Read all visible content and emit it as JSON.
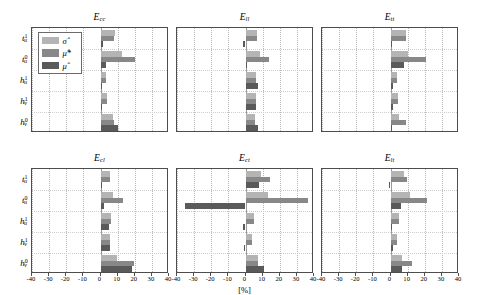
{
  "figure": {
    "xlabel": "[%]",
    "legend": [
      {
        "key": "sigma",
        "label_html": "σ̂",
        "color": "#b4b4b4"
      },
      {
        "key": "mustar",
        "label_html": "μ̂*",
        "color": "#888888"
      },
      {
        "key": "mu",
        "label_html": "μ̂",
        "color": "#5a5a5a"
      }
    ],
    "y_categories": [
      "t¹ᵤ",
      "t⁰ᵤ",
      "h¹ᵤ",
      "h¹ᵥ",
      "h⁰ᵥ"
    ],
    "y_categories_parts": [
      {
        "base": "t",
        "sup": "1",
        "sub": "u"
      },
      {
        "base": "t",
        "sup": "0",
        "sub": "u"
      },
      {
        "base": "h",
        "sup": "1",
        "sub": "u"
      },
      {
        "base": "h",
        "sup": "1",
        "sub": "v"
      },
      {
        "base": "h",
        "sup": "0",
        "sub": "v"
      }
    ],
    "x_ticks": [
      -40,
      -30,
      -20,
      -10,
      0,
      10,
      20,
      30,
      40
    ],
    "x_tick_labels": [
      "-40",
      "-30",
      "-20",
      "-10",
      "0",
      "10",
      "20",
      "30",
      "40"
    ],
    "xlim": [
      -40,
      40
    ]
  },
  "chart_data": {
    "type": "bar",
    "orientation": "horizontal",
    "title": "",
    "xlabel": "[%]",
    "ylabel": "",
    "xlim": [
      -40,
      40
    ],
    "grid": true,
    "legend_position": "upper-left-first-panel",
    "categories": [
      "t1_u",
      "t0_u",
      "h1_u",
      "h1_v",
      "h0_v"
    ],
    "series_names": [
      "sigma_hat",
      "mu_hat_star",
      "mu_hat"
    ],
    "panels": [
      {
        "id": "Ecc",
        "title_base": "E",
        "title_sub": "cc",
        "row": 0,
        "col": 0,
        "series": [
          {
            "name": "sigma_hat",
            "values": [
              8.5,
              12.5,
              3.5,
              4.0,
              7.5
            ]
          },
          {
            "name": "mu_hat_star",
            "values": [
              8.0,
              20.0,
              3.5,
              4.0,
              8.0
            ]
          },
          {
            "name": "mu_hat",
            "values": [
              1.5,
              3.0,
              0.7,
              0.0,
              10.0
            ]
          }
        ]
      },
      {
        "id": "Ell",
        "title_base": "E",
        "title_sub": "ll",
        "row": 0,
        "col": 1,
        "series": [
          {
            "name": "sigma_hat",
            "values": [
              7.0,
              8.5,
              6.0,
              6.0,
              5.5
            ]
          },
          {
            "name": "mu_hat_star",
            "values": [
              7.0,
              13.5,
              6.0,
              6.0,
              5.5
            ]
          },
          {
            "name": "mu_hat",
            "values": [
              -1.5,
              0.5,
              7.5,
              6.0,
              7.5
            ]
          }
        ]
      },
      {
        "id": "Ett",
        "title_base": "E",
        "title_sub": "tt",
        "row": 0,
        "col": 2,
        "series": [
          {
            "name": "sigma_hat",
            "values": [
              9.0,
              10.5,
              4.0,
              4.5,
              5.0
            ]
          },
          {
            "name": "mu_hat_star",
            "values": [
              9.0,
              21.0,
              4.0,
              4.5,
              9.0
            ]
          },
          {
            "name": "mu_hat",
            "values": [
              0.5,
              8.0,
              1.5,
              1.5,
              1.0
            ]
          }
        ]
      },
      {
        "id": "Ecl",
        "title_base": "E",
        "title_sub": "cl",
        "row": 1,
        "col": 0,
        "series": [
          {
            "name": "sigma_hat",
            "values": [
              5.5,
              7.5,
              6.0,
              5.5,
              9.5
            ]
          },
          {
            "name": "mu_hat_star",
            "values": [
              5.5,
              13.0,
              6.0,
              5.5,
              19.5
            ]
          },
          {
            "name": "mu_hat",
            "values": [
              0.5,
              2.0,
              5.0,
              5.5,
              18.5
            ]
          }
        ]
      },
      {
        "id": "Ect",
        "title_base": "E",
        "title_sub": "ct",
        "row": 1,
        "col": 1,
        "series": [
          {
            "name": "sigma_hat",
            "values": [
              9.0,
              13.0,
              5.0,
              4.0,
              7.5
            ]
          },
          {
            "name": "mu_hat_star",
            "values": [
              14.5,
              36.5,
              5.0,
              4.0,
              7.5
            ]
          },
          {
            "name": "mu_hat",
            "values": [
              8.0,
              -35.5,
              -1.5,
              -1.0,
              11.0
            ]
          }
        ]
      },
      {
        "id": "Elt",
        "title_base": "E",
        "title_sub": "lt",
        "row": 1,
        "col": 2,
        "series": [
          {
            "name": "sigma_hat",
            "values": [
              8.0,
              11.5,
              5.0,
              4.0,
              6.5
            ]
          },
          {
            "name": "mu_hat_star",
            "values": [
              9.5,
              21.5,
              5.0,
              4.0,
              12.5
            ]
          },
          {
            "name": "mu_hat",
            "values": [
              -1.0,
              6.0,
              0.5,
              1.5,
              6.5
            ]
          }
        ]
      }
    ]
  }
}
